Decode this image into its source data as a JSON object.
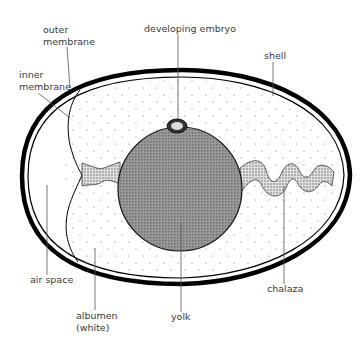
{
  "diagram": {
    "labels": {
      "outer_membrane": [
        "outer",
        "membrane"
      ],
      "inner_membrane": [
        "inner",
        "membrane"
      ],
      "developing_embryo": "developing embryo",
      "shell": "shell",
      "air_space": "air space",
      "albumen": [
        "albumen",
        "(white)"
      ],
      "yolk": "yolk",
      "chalaza": "chalaza"
    },
    "colors": {
      "shell": "#000000",
      "yolk": "#8a8a8a",
      "chalaza": "#c8c8c8",
      "label_text": "#3a3a3a",
      "leader_line": "#555555"
    }
  }
}
